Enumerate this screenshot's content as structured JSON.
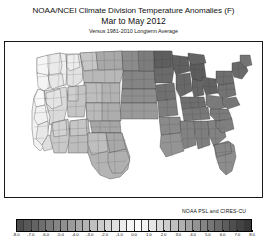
{
  "figure": {
    "title_line_1": "NOAA/NCEI Climate Division Temperature Anomalies (F)",
    "title_line_2": "Mar to May 2012",
    "title_line_3": "Versus 1981-2010 Longterm Average",
    "attribution": "NOAA PSL and CIRES-CU",
    "background_color": "#ffffff",
    "outline_color": "#000000"
  },
  "chart_data": {
    "type": "heatmap",
    "title": "NOAA/NCEI Climate Division Temperature Anomalies (F)",
    "subtitle": "Mar to May 2012",
    "note": "Versus 1981-2010 Longterm Average",
    "region": "Contiguous United States (CONUS) climate divisions",
    "variable": "Temperature anomaly",
    "units": "degrees Fahrenheit (F)",
    "season": "Mar to May 2012",
    "baseline": "1981-2010",
    "colormap": "grayscale diverging (dark-light-dark)",
    "legend_position": "bottom",
    "grid": false,
    "colorbar": {
      "vmin": -8.0,
      "vmax": 8.0,
      "step": 0.5,
      "n_cells": 32,
      "tick_labels": [
        "-8.0",
        "-7.0",
        "-6.0",
        "-5.0",
        "-4.0",
        "-3.0",
        "-2.0",
        "-1.0",
        "0.0",
        "1.0",
        "2.0",
        "3.0",
        "4.0",
        "5.0",
        "6.0",
        "7.0",
        "8.0"
      ],
      "tick_values": [
        -8.0,
        -7.0,
        -6.0,
        -5.0,
        -4.0,
        -3.0,
        -2.0,
        -1.0,
        0.0,
        1.0,
        2.0,
        3.0,
        4.0,
        5.0,
        6.0,
        7.0,
        8.0
      ],
      "cell_colors": [
        "#4d4d4d",
        "#585858",
        "#636363",
        "#6e6e6e",
        "#7a7a7a",
        "#858585",
        "#909090",
        "#9b9b9b",
        "#a8a8a8",
        "#b4b4b4",
        "#c0c0c0",
        "#cccccc",
        "#d6d6d6",
        "#e0e0e0",
        "#ebebeb",
        "#f5f5f5",
        "#fcfcfc",
        "#f2f2f2",
        "#e6e6e6",
        "#d9d9d9",
        "#cccccc",
        "#bfbfbf",
        "#b0b0b0",
        "#a2a2a2",
        "#939393",
        "#848484",
        "#767676",
        "#696969",
        "#5c5c5c",
        "#4f4f4f",
        "#434343",
        "#383838"
      ]
    },
    "regional_summary": [
      {
        "region": "Pacific Northwest / coastal Washington and Oregon",
        "anomaly": -1.5,
        "shade": "light",
        "description": "Near normal to slightly below normal"
      },
      {
        "region": "Northern California and coastal California",
        "anomaly": -0.5,
        "shade": "light",
        "description": "Near normal"
      },
      {
        "region": "Great Basin / Nevada / Idaho",
        "anomaly": 1.0,
        "shade": "light-medium",
        "description": "Slightly above normal"
      },
      {
        "region": "Northern Rockies / Montana / Wyoming",
        "anomaly": 2.5,
        "shade": "medium",
        "description": "Above normal"
      },
      {
        "region": "Southwest / Arizona / New Mexico",
        "anomaly": 2.5,
        "shade": "medium",
        "description": "Above normal"
      },
      {
        "region": "Northern Plains / Dakotas / Nebraska",
        "anomaly": 4.5,
        "shade": "dark",
        "description": "Well above normal"
      },
      {
        "region": "Upper Midwest / Minnesota / Wisconsin / Michigan",
        "anomaly": 6.5,
        "shade": "very dark",
        "description": "Record warm"
      },
      {
        "region": "Ohio Valley / Illinois / Indiana / Ohio",
        "anomaly": 6.0,
        "shade": "very dark",
        "description": "Record warm"
      },
      {
        "region": "Northeast / New England / New York",
        "anomaly": 5.0,
        "shade": "dark",
        "description": "Well above normal"
      },
      {
        "region": "Mid-Atlantic / Pennsylvania / Virginia",
        "anomaly": 4.5,
        "shade": "dark",
        "description": "Well above normal"
      },
      {
        "region": "Southeast / Georgia / Carolinas / Florida",
        "anomaly": 3.5,
        "shade": "medium-dark",
        "description": "Above normal"
      },
      {
        "region": "Gulf Coast / Louisiana / Mississippi / Alabama",
        "anomaly": 3.0,
        "shade": "medium-dark",
        "description": "Above normal"
      },
      {
        "region": "Southern Plains / Texas / Oklahoma",
        "anomaly": 2.5,
        "shade": "medium",
        "description": "Above normal"
      }
    ]
  }
}
